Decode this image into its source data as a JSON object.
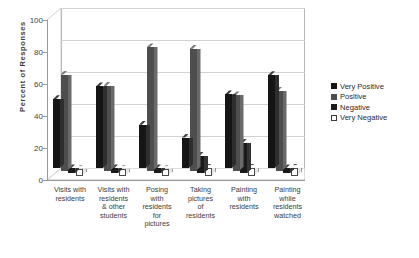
{
  "chart_data": {
    "type": "bar",
    "title": "",
    "xlabel": "",
    "ylabel": "Percent of Responses",
    "ylim": [
      0,
      100
    ],
    "yticks": [
      0,
      20,
      40,
      60,
      80,
      100
    ],
    "grid": true,
    "legend_position": "right",
    "style": "3d-grouped-column",
    "categories": [
      "Visits with residents",
      "Visits with residents & other students",
      "Posing with residents for pictures",
      "Taking pictures of residents",
      "Painting with residents",
      "Painting while residents watched"
    ],
    "category_lines": [
      [
        "Visits with",
        "residents"
      ],
      [
        "Visits with",
        "residents",
        "& other",
        "students"
      ],
      [
        "Posing",
        "with",
        "residents",
        "for",
        "pictures"
      ],
      [
        "Taking",
        "pictures",
        "of",
        "residents"
      ],
      [
        "Painting",
        "with",
        "residents"
      ],
      [
        "Painting",
        "while",
        "residents",
        "watched"
      ]
    ],
    "series": [
      {
        "name": "Very Positive",
        "color": "#151515",
        "values": [
          43,
          51,
          27,
          19,
          46,
          58
        ]
      },
      {
        "name": "Positive",
        "color": "#4e4e4e",
        "values": [
          60,
          53,
          77,
          76,
          47,
          50
        ]
      },
      {
        "name": "Negative",
        "color": "#1a1a1a",
        "values": [
          3,
          3,
          3,
          11,
          19,
          3
        ]
      },
      {
        "name": "Very Negative",
        "color": "#ffffff",
        "values": [
          4,
          4,
          4,
          5,
          5,
          5
        ]
      }
    ]
  },
  "legend": {
    "items": [
      {
        "label": "Very Positive"
      },
      {
        "label": "Positive"
      },
      {
        "label": "Negative"
      },
      {
        "label": "Very Negative"
      }
    ]
  }
}
